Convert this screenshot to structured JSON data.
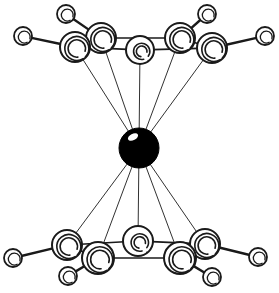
{
  "figure": {
    "type": "ball-and-stick-molecular-diagram",
    "width": 279,
    "height": 293,
    "background_color": "#ffffff",
    "outline_color": "#1a1a1a",
    "metal_fill_color": "#000000",
    "atom_fill_color": "#ffffff",
    "highlight_color": "#ffffff"
  },
  "atoms": {
    "metal_center": {
      "label": "metal-center-atom",
      "cx": 139,
      "cy": 148,
      "r": 20,
      "style": "filled",
      "highlight": {
        "cx": 133,
        "cy": 137,
        "rx": 5.5,
        "ry": 3.2,
        "rot": -28
      }
    },
    "top_ring_carbons": [
      {
        "label": "C1",
        "cx": 75,
        "cy": 47,
        "r": 15,
        "shade": 1
      },
      {
        "label": "C2",
        "cx": 101,
        "cy": 38,
        "r": 15,
        "shade": 1
      },
      {
        "label": "C3",
        "cx": 140,
        "cy": 50,
        "r": 14,
        "shade": 2
      },
      {
        "label": "C4",
        "cx": 180,
        "cy": 38,
        "r": 15,
        "shade": 1
      },
      {
        "label": "C5",
        "cx": 212,
        "cy": 48,
        "r": 15,
        "shade": 1
      }
    ],
    "top_ring_substituents": [
      {
        "label": "H1",
        "cx": 23,
        "cy": 36,
        "r": 9
      },
      {
        "label": "H2",
        "cx": 66,
        "cy": 14,
        "r": 9
      },
      {
        "label": "H4",
        "cx": 207,
        "cy": 14,
        "r": 9
      },
      {
        "label": "H5",
        "cx": 265,
        "cy": 36,
        "r": 9
      }
    ],
    "bottom_ring_carbons": [
      {
        "label": "C6",
        "cx": 67,
        "cy": 245,
        "r": 15,
        "shade": 1
      },
      {
        "label": "C7",
        "cx": 98,
        "cy": 258,
        "r": 16,
        "shade": 1
      },
      {
        "label": "C8",
        "cx": 138,
        "cy": 241,
        "r": 15,
        "shade": 2
      },
      {
        "label": "C9",
        "cx": 180,
        "cy": 258,
        "r": 16,
        "shade": 1
      },
      {
        "label": "C10",
        "cx": 205,
        "cy": 244,
        "r": 15,
        "shade": 1
      }
    ],
    "bottom_ring_substituents": [
      {
        "label": "H6",
        "cx": 13,
        "cy": 258,
        "r": 9
      },
      {
        "label": "H7",
        "cx": 68,
        "cy": 276,
        "r": 9
      },
      {
        "label": "H9",
        "cx": 212,
        "cy": 277,
        "r": 9
      },
      {
        "label": "H10",
        "cx": 258,
        "cy": 257,
        "r": 9
      }
    ]
  },
  "bonds": {
    "ring_bonds_top": [
      {
        "from": "C1",
        "to": "C2"
      },
      {
        "from": "C2",
        "to": "C4"
      },
      {
        "from": "C4",
        "to": "C5"
      },
      {
        "from": "C1",
        "to": "C3"
      },
      {
        "from": "C3",
        "to": "C5"
      }
    ],
    "ring_bonds_bottom": [
      {
        "from": "C6",
        "to": "C7"
      },
      {
        "from": "C7",
        "to": "C9"
      },
      {
        "from": "C9",
        "to": "C10"
      },
      {
        "from": "C6",
        "to": "C8"
      },
      {
        "from": "C8",
        "to": "C10"
      }
    ],
    "substituent_bonds": [
      {
        "from": "C1",
        "to": "H1"
      },
      {
        "from": "C2",
        "to": "H2"
      },
      {
        "from": "C4",
        "to": "H4"
      },
      {
        "from": "C5",
        "to": "H5"
      },
      {
        "from": "C6",
        "to": "H6"
      },
      {
        "from": "C7",
        "to": "H7"
      },
      {
        "from": "C9",
        "to": "H9"
      },
      {
        "from": "C10",
        "to": "H10"
      }
    ],
    "metal_bonds_top": [
      {
        "from": "metal_center",
        "to": "C1"
      },
      {
        "from": "metal_center",
        "to": "C2"
      },
      {
        "from": "metal_center",
        "to": "C3"
      },
      {
        "from": "metal_center",
        "to": "C4"
      },
      {
        "from": "metal_center",
        "to": "C5"
      }
    ],
    "metal_bonds_bottom": [
      {
        "from": "metal_center",
        "to": "C6"
      },
      {
        "from": "metal_center",
        "to": "C7"
      },
      {
        "from": "metal_center",
        "to": "C8"
      },
      {
        "from": "metal_center",
        "to": "C9"
      },
      {
        "from": "metal_center",
        "to": "C10"
      }
    ]
  },
  "line_widths": {
    "bond_thick": 2.4,
    "bond_medium": 1.7,
    "bond_thin": 0.9,
    "circle_stroke": 2.0,
    "small_circle_stroke": 1.8,
    "shade_stroke": 1.6
  }
}
